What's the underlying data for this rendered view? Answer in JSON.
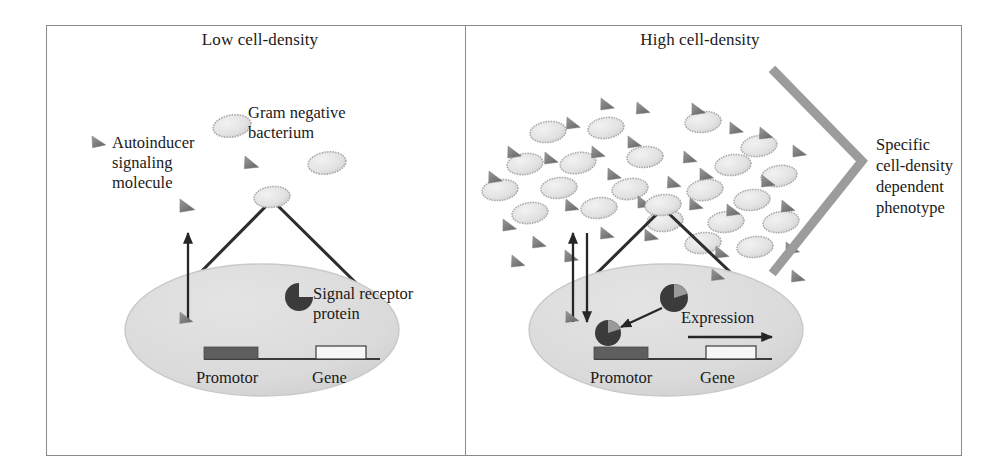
{
  "figure": {
    "kind": "quorum-sensing-schematic",
    "panels": [
      {
        "id": "low",
        "title": "Low cell-density",
        "labels": {
          "autoinducer": "Autoinducer\nsignaling\nmolecule",
          "bacterium": "Gram negative\nbacterium",
          "receptor": "Signal receptor\nprotein",
          "promotor": "Promotor",
          "gene": "Gene"
        }
      },
      {
        "id": "high",
        "title": "High cell-density",
        "labels": {
          "expression": "Expression",
          "promotor": "Promotor",
          "gene": "Gene",
          "phenotype": "Specific\ncell-density\ndependent\nphenotype"
        }
      }
    ],
    "colors": {
      "frame_line": "#8a8a8a",
      "cell_fill": "#dcdcdc",
      "cell_stroke": "#c2c2c2",
      "bacterium_fill": "#e2e2e2",
      "bacterium_stroke": "#a9a9a9",
      "autoinducer_fill": "#8d8d8d",
      "receptor_dark": "#3b3b3b",
      "receptor_wedge": "#9a9a9a",
      "promotor_bar": "#5e5e5e",
      "gene_bar": "#f4f4f4",
      "dna_line": "#3a3a3a",
      "arrow": "#262626",
      "phenotype_bracket": "#9c9c9c",
      "text": "#1a1a1a"
    },
    "counts": {
      "low_panel_bacteria": 3,
      "low_panel_autoinducers_outside": 3,
      "low_panel_autoinducers_inside": 1,
      "high_panel_bacteria": 22,
      "high_panel_autoinducers": 30
    },
    "low_panel_geometry": {
      "cell_ellipse": {
        "cx": 262,
        "cy": 330,
        "rx": 137,
        "ry": 66
      },
      "zoom_source_oval": {
        "cx": 272,
        "cy": 197,
        "rx": 17,
        "ry": 10
      },
      "uptake_arrow": {
        "x": 188,
        "y1": 320,
        "y2": 231
      },
      "bacteria": [
        {
          "cx": 232,
          "cy": 126,
          "rx": 19,
          "ry": 11,
          "rot": -10
        },
        {
          "cx": 327,
          "cy": 163,
          "rx": 19,
          "ry": 11,
          "rot": -8
        },
        {
          "cx": 272,
          "cy": 197,
          "rx": 18,
          "ry": 10,
          "rot": -6
        }
      ],
      "autoinducers": [
        {
          "x": 98,
          "y": 140,
          "s": 11,
          "rot": -12
        },
        {
          "x": 184,
          "y": 205,
          "s": 12,
          "rot": -8
        },
        {
          "x": 248,
          "y": 163,
          "s": 11,
          "rot": -6
        },
        {
          "x": 184,
          "y": 318,
          "s": 11,
          "rot": -8
        }
      ],
      "receptor": {
        "cx": 299,
        "cy": 297,
        "r": 13
      },
      "promotor_bar": {
        "x": 204,
        "y": 348,
        "w": 54,
        "h": 11
      },
      "gene_bar": {
        "x": 316,
        "y": 347,
        "w": 50,
        "h": 12
      },
      "dna_line": {
        "x1": 204,
        "x2": 380,
        "y": 359
      }
    },
    "high_panel_geometry": {
      "cell_ellipse": {
        "cx": 666,
        "cy": 330,
        "rx": 137,
        "ry": 66
      },
      "zoom_source_oval": {
        "cx": 663,
        "cy": 205,
        "rx": 18,
        "ry": 10
      },
      "uptake_arrow_up": {
        "x": 573,
        "y1": 320,
        "y2": 231
      },
      "efflux_arrow_down": {
        "x": 586,
        "y1": 231,
        "y2": 320
      },
      "receptor_free": {
        "cx": 674,
        "cy": 298,
        "r": 14
      },
      "receptor_bound": {
        "cx": 608,
        "cy": 333,
        "r": 13
      },
      "binding_arrow": {
        "x1": 660,
        "y1": 307,
        "x2": 619,
        "y2": 326
      },
      "expression_arrow": {
        "x1": 688,
        "y1": 337,
        "x2": 770,
        "y2": 337
      },
      "promotor_bar": {
        "x": 594,
        "y": 348,
        "w": 54,
        "h": 11
      },
      "gene_bar": {
        "x": 706,
        "y": 347,
        "w": 50,
        "h": 12
      },
      "dna_line": {
        "x1": 594,
        "x2": 770,
        "y": 359
      },
      "phenotype_bracket": [
        [
          775,
          72
        ],
        [
          862,
          161
        ],
        [
          775,
          270
        ]
      ]
    }
  }
}
